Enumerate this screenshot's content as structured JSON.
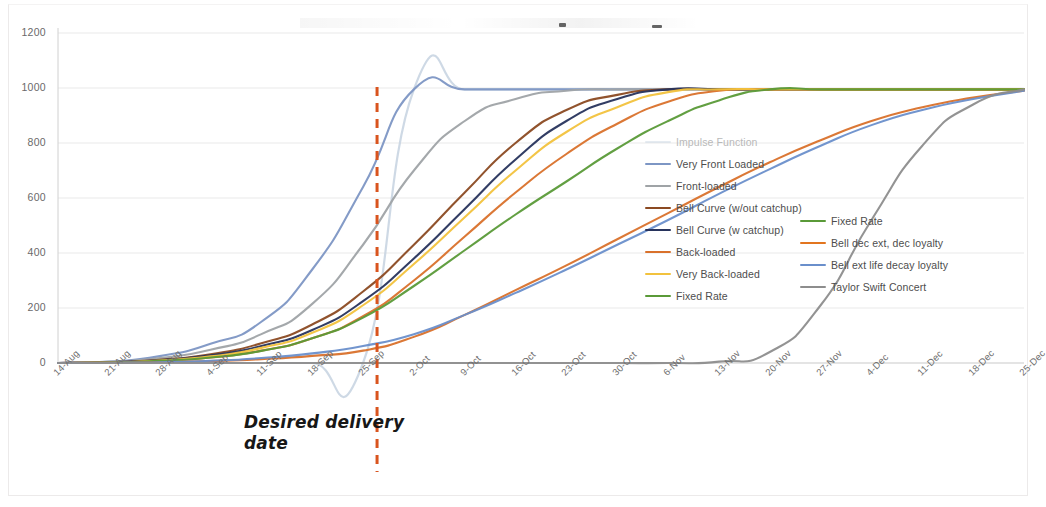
{
  "chart_data": {
    "type": "line",
    "title": "",
    "xlabel": "",
    "ylabel": "",
    "ylim": [
      0,
      1200
    ],
    "yticks": [
      0,
      200,
      400,
      600,
      800,
      1000,
      1200
    ],
    "grid": true,
    "legend_position": "inside-right",
    "categories": [
      "14-Aug",
      "21-Aug",
      "28-Aug",
      "4-Sep",
      "11-Sep",
      "18-Sep",
      "25-Sep",
      "2-Oct",
      "9-Oct",
      "16-Oct",
      "23-Oct",
      "30-Oct",
      "6-Nov",
      "13-Nov",
      "20-Nov",
      "27-Nov",
      "4-Dec",
      "11-Dec",
      "18-Dec",
      "25-Dec"
    ],
    "series": [
      {
        "name": "Impulse Function",
        "color": "#c6d2e0",
        "values": [
          0,
          0,
          0,
          0,
          0,
          0,
          0,
          995,
          995,
          995,
          995,
          995,
          995,
          995,
          995,
          995,
          995,
          995,
          995,
          995
        ]
      },
      {
        "name": "Very Front Loaded",
        "color": "#7d96c4",
        "values": [
          0,
          5,
          25,
          70,
          150,
          340,
          640,
          995,
          995,
          995,
          995,
          995,
          995,
          995,
          995,
          995,
          995,
          995,
          995,
          995
        ]
      },
      {
        "name": "Front-loaded",
        "color": "#9fa3a6",
        "values": [
          0,
          4,
          18,
          48,
          105,
          215,
          430,
          700,
          880,
          960,
          990,
          995,
          995,
          995,
          995,
          995,
          995,
          995,
          995,
          995
        ]
      },
      {
        "name": "Bell Curve (w/out catchup)",
        "color": "#8b4a22",
        "values": [
          0,
          3,
          12,
          32,
          72,
          140,
          260,
          430,
          620,
          800,
          920,
          975,
          995,
          995,
          995,
          995,
          995,
          995,
          995,
          995
        ]
      },
      {
        "name": "Bell Curve (w catchup)",
        "color": "#27335c",
        "values": [
          0,
          3,
          11,
          28,
          62,
          120,
          225,
          380,
          560,
          740,
          880,
          960,
          995,
          995,
          995,
          995,
          995,
          995,
          995,
          995
        ]
      },
      {
        "name": "Back-loaded",
        "color": "#d9712b",
        "values": [
          0,
          2,
          8,
          20,
          45,
          90,
          170,
          300,
          460,
          620,
          760,
          870,
          950,
          990,
          995,
          995,
          995,
          995,
          995,
          995
        ]
      },
      {
        "name": "Very Back-loaded",
        "color": "#f2c23d",
        "values": [
          0,
          2,
          9,
          24,
          55,
          110,
          210,
          360,
          530,
          700,
          840,
          930,
          985,
          995,
          995,
          995,
          995,
          995,
          995,
          995
        ]
      },
      {
        "name": "Fixed Rate",
        "color": "#5a9a38",
        "values": [
          0,
          2,
          8,
          20,
          44,
          90,
          165,
          280,
          410,
          540,
          660,
          780,
          880,
          955,
          995,
          995,
          995,
          995,
          995,
          995
        ]
      },
      {
        "name": "Bell dec ext, dec loyalty",
        "color": "#d9712b",
        "values": [
          0,
          1,
          3,
          7,
          14,
          26,
          45,
          95,
          175,
          265,
          355,
          450,
          545,
          640,
          730,
          810,
          880,
          930,
          965,
          990
        ]
      },
      {
        "name": "Bell ext life decay loyalty",
        "color": "#6a8fcb",
        "values": [
          0,
          1,
          3,
          8,
          18,
          35,
          62,
          105,
          175,
          255,
          340,
          430,
          520,
          615,
          705,
          790,
          865,
          920,
          960,
          990
        ]
      },
      {
        "name": "Taylor Swift Concert",
        "color": "#8d8d8d",
        "values": [
          0,
          0,
          0,
          0,
          0,
          0,
          0,
          0,
          0,
          0,
          0,
          0,
          0,
          5,
          40,
          210,
          520,
          790,
          940,
          995
        ]
      }
    ],
    "reference_line": {
      "label": "Desired delivery date",
      "x_category": "25-Sep",
      "color": "#d9541e",
      "style": "dashed"
    }
  },
  "legend": {
    "column_left": [
      {
        "label": "Impulse Function",
        "color": "#c6d2e0",
        "faded": true
      },
      {
        "label": "Very Front Loaded",
        "color": "#7d96c4",
        "faded": false
      },
      {
        "label": "Front-loaded",
        "color": "#9fa3a6",
        "faded": false
      },
      {
        "label": "Bell Curve (w/out catchup)",
        "color": "#8b4a22",
        "faded": false
      },
      {
        "label": "Bell Curve (w catchup)",
        "color": "#27335c",
        "faded": false
      },
      {
        "label": "Back-loaded",
        "color": "#d9712b",
        "faded": false
      },
      {
        "label": "Very Back-loaded",
        "color": "#f2c23d",
        "faded": false
      },
      {
        "label": "Fixed Rate",
        "color": "#5a9a38",
        "faded": false
      }
    ],
    "column_right": [
      {
        "label": "Fixed Rate",
        "color": "#5a9a38",
        "faded": false
      },
      {
        "label": "Bell dec ext, dec loyalty",
        "color": "#e2751f",
        "faded": false
      },
      {
        "label": "Bell ext life decay loyalty",
        "color": "#6a8fcb",
        "faded": false
      },
      {
        "label": "Taylor Swift Concert",
        "color": "#8d8d8d",
        "faded": false
      }
    ]
  },
  "annotation": {
    "line1": "Desired delivery",
    "line2": "date"
  }
}
